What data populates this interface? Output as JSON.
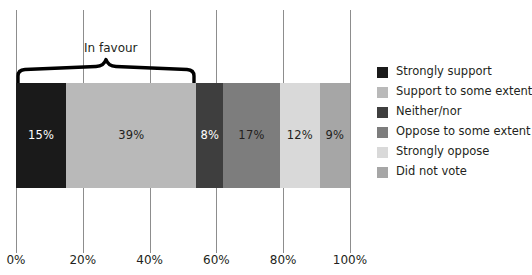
{
  "chart_data": {
    "type": "bar",
    "orientation": "horizontal",
    "stacked": true,
    "title": "",
    "xlabel": "",
    "ylabel": "",
    "xlim": [
      0,
      100
    ],
    "grid": true,
    "legend_position": "right",
    "categories": [
      ""
    ],
    "tick_labels": [
      "0%",
      "20%",
      "40%",
      "60%",
      "80%",
      "100%"
    ],
    "tick_values": [
      0,
      20,
      40,
      60,
      80,
      100
    ],
    "series": [
      {
        "name": "Strongly support",
        "value": 15,
        "label": "15%",
        "color": "#1a1a1a",
        "label_color": "light"
      },
      {
        "name": "Support to some extent",
        "value": 39,
        "label": "39%",
        "color": "#b9b9b9",
        "label_color": "dark"
      },
      {
        "name": "Neither/nor",
        "value": 8,
        "label": "8%",
        "color": "#3e3e3e",
        "label_color": "light"
      },
      {
        "name": "Oppose to some extent",
        "value": 17,
        "label": "17%",
        "color": "#7d7d7d",
        "label_color": "dark"
      },
      {
        "name": "Strongly oppose",
        "value": 12,
        "label": "12%",
        "color": "#d9d9d9",
        "label_color": "dark"
      },
      {
        "name": "Did not vote",
        "value": 9,
        "label": "9%",
        "color": "#a6a6a6",
        "label_color": "dark"
      }
    ],
    "annotations": [
      {
        "text": "In favour",
        "type": "brace",
        "span_start": 0,
        "span_end": 54
      }
    ]
  },
  "legend": {
    "items": [
      {
        "label": "Strongly support",
        "color": "#1a1a1a"
      },
      {
        "label": "Support to some extent",
        "color": "#b9b9b9"
      },
      {
        "label": "Neither/nor",
        "color": "#3e3e3e"
      },
      {
        "label": "Oppose to some extent",
        "color": "#7d7d7d"
      },
      {
        "label": "Strongly oppose",
        "color": "#d9d9d9"
      },
      {
        "label": "Did not vote",
        "color": "#a6a6a6"
      }
    ]
  }
}
